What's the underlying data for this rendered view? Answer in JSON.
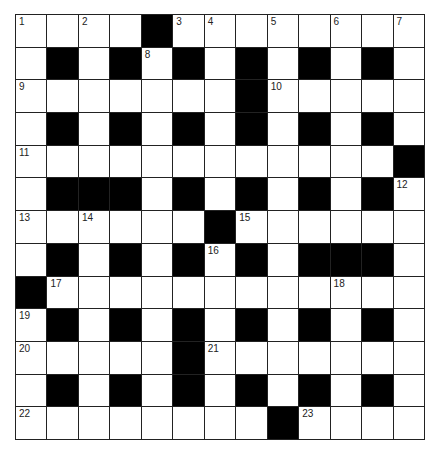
{
  "puzzle": {
    "rows": 13,
    "cols": 13,
    "colors": {
      "block": "#000000",
      "cell": "#ffffff",
      "line": "#222222"
    },
    "grid": [
      "....#........",
      ".#.#.#.#.#.#.",
      ".......#.....",
      ".#.#.#.#.#.#.",
      "............#",
      ".###.#.#.#.#.",
      "......#......",
      ".#.#.#.#.###.",
      "#............",
      ".#.#.#.#.#.#.",
      ".....#.......",
      ".#.#.#.#.#.#.",
      "........#...."
    ],
    "numbers": [
      {
        "row": 0,
        "col": 0,
        "n": "1"
      },
      {
        "row": 0,
        "col": 2,
        "n": "2"
      },
      {
        "row": 0,
        "col": 5,
        "n": "3"
      },
      {
        "row": 0,
        "col": 6,
        "n": "4"
      },
      {
        "row": 0,
        "col": 8,
        "n": "5"
      },
      {
        "row": 0,
        "col": 10,
        "n": "6"
      },
      {
        "row": 0,
        "col": 12,
        "n": "7"
      },
      {
        "row": 1,
        "col": 4,
        "n": "8"
      },
      {
        "row": 2,
        "col": 0,
        "n": "9"
      },
      {
        "row": 2,
        "col": 8,
        "n": "10"
      },
      {
        "row": 4,
        "col": 0,
        "n": "11"
      },
      {
        "row": 5,
        "col": 12,
        "n": "12"
      },
      {
        "row": 6,
        "col": 0,
        "n": "13"
      },
      {
        "row": 6,
        "col": 2,
        "n": "14"
      },
      {
        "row": 6,
        "col": 7,
        "n": "15"
      },
      {
        "row": 7,
        "col": 6,
        "n": "16"
      },
      {
        "row": 8,
        "col": 1,
        "n": "17"
      },
      {
        "row": 8,
        "col": 10,
        "n": "18"
      },
      {
        "row": 9,
        "col": 0,
        "n": "19"
      },
      {
        "row": 10,
        "col": 0,
        "n": "20"
      },
      {
        "row": 10,
        "col": 6,
        "n": "21"
      },
      {
        "row": 12,
        "col": 0,
        "n": "22"
      },
      {
        "row": 12,
        "col": 9,
        "n": "23"
      }
    ]
  }
}
